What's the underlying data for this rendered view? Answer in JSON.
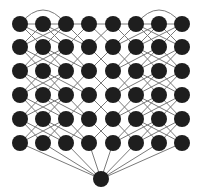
{
  "diagram": {
    "type": "layered-network-graph",
    "colors": {
      "node": "#1e1e1e",
      "edge": "#7a7a7a",
      "background": "#ffffff"
    },
    "node_radius": 8,
    "columns_x": [
      20,
      43,
      66,
      89,
      113,
      136,
      159,
      182
    ],
    "rows_y": [
      24,
      47,
      71,
      95,
      119,
      143
    ],
    "sink": {
      "x": 101,
      "y": 179,
      "r": 8
    },
    "top_row_horizontal_edge": {
      "from_col": 0,
      "to_col": 7
    },
    "top_arcs": [
      {
        "from_col": 0,
        "to_col": 2,
        "height": 14
      },
      {
        "from_col": 5,
        "to_col": 7,
        "height": 14
      }
    ],
    "inter_row_offsets": {
      "0": [
        1,
        2
      ],
      "1": [
        -1,
        1,
        2
      ],
      "2": [
        -2,
        -1,
        1
      ],
      "3": [
        -1,
        1
      ],
      "4": [
        -1,
        1
      ],
      "5": [
        -1,
        1,
        2
      ],
      "6": [
        -2,
        -1,
        1
      ],
      "7": [
        -2,
        -1
      ]
    },
    "sink_connects_to_last_row": true
  }
}
